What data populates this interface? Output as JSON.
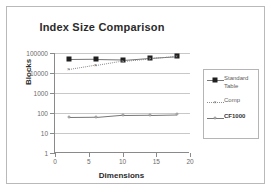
{
  "chart_data": {
    "type": "line",
    "title": "Index Size Comparison",
    "xlabel": "Dimensions",
    "ylabel": "Blocks",
    "yscale": "log",
    "ylim": [
      1,
      100000
    ],
    "xlim": [
      0,
      20
    ],
    "grid": true,
    "legend_position": "right",
    "x": [
      2,
      6,
      10,
      14,
      18
    ],
    "xticks": [
      0,
      5,
      10,
      15,
      20
    ],
    "yticks": [
      1,
      10,
      100,
      1000,
      10000,
      100000
    ],
    "ytick_labels": [
      "1",
      "10",
      "100",
      "1000",
      "10000",
      "100000"
    ],
    "series": [
      {
        "name": "Standard Table",
        "legend_label": "Standard\nTable",
        "marker": "filled-square",
        "line": "solid",
        "bold_label": false,
        "values": [
          48000,
          49000,
          46000,
          58000,
          71000
        ]
      },
      {
        "name": "Comp",
        "legend_label": "Comp",
        "marker": "cross",
        "line": "dotted",
        "bold_label": false,
        "values": [
          15000,
          25000,
          42000,
          56000,
          70000
        ]
      },
      {
        "name": "CF1000",
        "legend_label": "CF1000",
        "marker": "open-circle",
        "line": "solid",
        "bold_label": true,
        "values": [
          62,
          63,
          82,
          84,
          90
        ]
      }
    ]
  },
  "colors": {
    "frame_border": "#b9b9b9",
    "axis": "#8a8a8a",
    "gridline": "#c8c8c8",
    "text": "#3a3a3a",
    "marker_dark": "#1f1f1f",
    "line_gray": "#777777"
  }
}
